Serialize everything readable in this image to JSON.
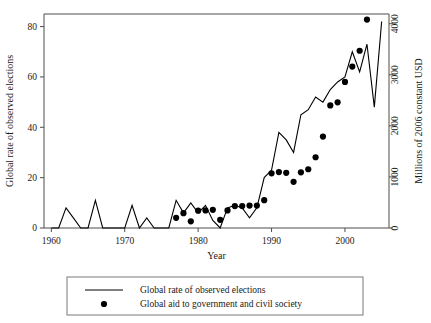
{
  "chart_data": {
    "type": "line",
    "title": "",
    "xlabel": "Year",
    "ylabel": "Global rate of  observed elections",
    "y2label": "Millions of  2006 constant USD",
    "xlim": [
      1959,
      2006
    ],
    "ylim": [
      0,
      85
    ],
    "y2lim": [
      0,
      4190
    ],
    "grid": false,
    "legend_position": "bottom",
    "xticks": [
      1960,
      1970,
      1980,
      1990,
      2000
    ],
    "xticklabels": [
      "1960",
      "1970",
      "1980",
      "1990",
      "2000"
    ],
    "yticks": [
      0,
      20,
      40,
      60,
      80
    ],
    "yticklabels": [
      "0",
      "20",
      "40",
      "60",
      "80"
    ],
    "y2ticks": [
      0,
      1000,
      2000,
      3000,
      4000
    ],
    "y2ticklabels": [
      "0",
      "1000",
      "2000",
      "3000",
      "4000"
    ],
    "series": [
      {
        "name": "Global rate of  observed elections",
        "type": "line",
        "axis": "left",
        "x": [
          1960,
          1961,
          1962,
          1963,
          1964,
          1965,
          1966,
          1967,
          1968,
          1969,
          1970,
          1971,
          1972,
          1973,
          1974,
          1975,
          1976,
          1977,
          1978,
          1979,
          1980,
          1981,
          1982,
          1983,
          1984,
          1985,
          1986,
          1987,
          1988,
          1989,
          1990,
          1991,
          1992,
          1993,
          1994,
          1995,
          1996,
          1997,
          1998,
          1999,
          2000,
          2001,
          2002,
          2003,
          2004,
          2005
        ],
        "values": [
          0,
          0,
          8,
          4,
          0,
          0,
          11,
          0,
          0,
          0,
          0,
          9,
          0,
          4,
          0,
          0,
          0,
          11,
          6,
          10,
          6,
          9,
          3,
          0,
          8,
          9,
          8,
          4,
          8,
          20,
          23,
          38,
          35,
          30,
          45,
          47,
          52,
          50,
          55,
          58,
          60,
          70,
          62,
          73,
          48,
          82
        ]
      },
      {
        "name": "Global aid to government and civil society",
        "type": "scatter",
        "axis": "right",
        "x": [
          1977,
          1978,
          1979,
          1980,
          1981,
          1982,
          1983,
          1984,
          1985,
          1986,
          1987,
          1988,
          1989,
          1990,
          1991,
          1992,
          1993,
          1994,
          1995,
          1996,
          1997,
          1998,
          1999,
          2000,
          2001,
          2002,
          2003
        ],
        "values": [
          200,
          290,
          130,
          340,
          345,
          355,
          160,
          345,
          430,
          430,
          440,
          440,
          545,
          1070,
          1095,
          1080,
          905,
          1090,
          1150,
          1385,
          1790,
          2400,
          2460,
          2860,
          3160,
          3470,
          4080
        ]
      }
    ],
    "legend": [
      {
        "label": "Global rate of  observed elections",
        "marker": "line"
      },
      {
        "label": "Global aid to government and civil society",
        "marker": "dot"
      }
    ]
  }
}
